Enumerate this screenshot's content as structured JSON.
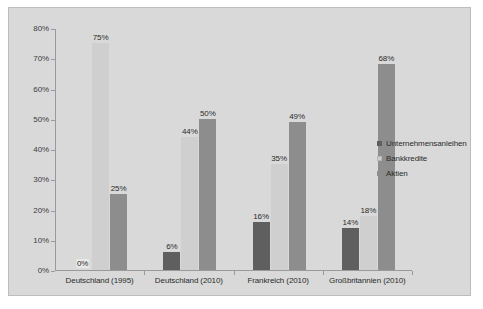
{
  "chart_data": {
    "type": "bar",
    "title": "",
    "subtitle": "",
    "xlabel": "",
    "ylabel": "",
    "ylim": [
      0,
      80
    ],
    "grid": false,
    "legend_position": "right",
    "categories": [
      "Deutschland (1995)",
      "Deutschland (2010)",
      "Frankreich (2010)",
      "Großbritannien (2010)"
    ],
    "ytick_labels": [
      "0%",
      "10%",
      "20%",
      "30%",
      "40%",
      "50%",
      "60%",
      "70%",
      "80%"
    ],
    "ytick_values": [
      0,
      10,
      20,
      30,
      40,
      50,
      60,
      70,
      80
    ],
    "series": [
      {
        "name": "Unternehmensanleihen",
        "color": "#5f5f5f",
        "values": [
          0,
          6,
          16,
          14
        ],
        "data_labels": [
          "0%",
          "6%",
          "16%",
          "14%"
        ]
      },
      {
        "name": "Bankkredite",
        "color": "#cfcfcf",
        "values": [
          75,
          44,
          35,
          18
        ],
        "data_labels": [
          "75%",
          "44%",
          "35%",
          "18%"
        ]
      },
      {
        "name": "Aktien",
        "color": "#8d8d8d",
        "values": [
          25,
          50,
          49,
          68
        ],
        "data_labels": [
          "25%",
          "50%",
          "49%",
          "68%"
        ]
      }
    ]
  },
  "legend": {
    "items": [
      {
        "label": "Unternehmensanleihen"
      },
      {
        "label": "Bankkredite"
      },
      {
        "label": "Aktien"
      }
    ]
  },
  "colors": {
    "background": "#d9d9d9",
    "page": "#ffffff",
    "axis": "#9a9a9a",
    "text": "#2b2b2b",
    "series_0": "#5f5f5f",
    "series_1": "#cfcfcf",
    "series_2": "#8d8d8d"
  }
}
